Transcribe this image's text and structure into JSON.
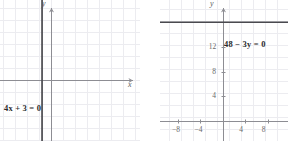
{
  "figure": {
    "background_color": "#ffffff",
    "grid_color": "#ececf0",
    "axis_color": "#8d8d93",
    "curve_color": "#4a4a4f",
    "text_color": "#5c5c5c",
    "label_color": "#2b2b2b"
  },
  "chart_data": [
    {
      "type": "line",
      "title": "",
      "subtitle": "",
      "equation_label": "4x + 3 = 0",
      "xlabel": "x",
      "ylabel": "y",
      "grid": true,
      "legend": "none",
      "annotations": [
        "4x + 3 = 0"
      ],
      "xlim": [
        -4.25,
        7.4
      ],
      "ylim": [
        -5.1,
        6.7
      ],
      "xticks": [],
      "yticks": [],
      "xtick_labels": [],
      "ytick_labels": [],
      "series": [
        {
          "name": "4x + 3 = 0",
          "kind": "vertical-line",
          "x_value": -0.75,
          "x": [
            -0.75,
            -0.75
          ],
          "y": [
            -5.1,
            6.7
          ]
        }
      ]
    },
    {
      "type": "line",
      "title": "",
      "subtitle": "",
      "equation_label": "48 − 3y = 0",
      "xlabel": "",
      "ylabel": "y",
      "grid": true,
      "legend": "none",
      "annotations": [
        "48 − 3y = 0"
      ],
      "xlim": [
        -11.2,
        11.6
      ],
      "ylim": [
        -3.2,
        19.6
      ],
      "xticks": [
        -8,
        -4,
        4,
        8
      ],
      "yticks": [
        4,
        8,
        12
      ],
      "xtick_labels": [
        "−8",
        "−4",
        "4",
        "8"
      ],
      "ytick_labels": [
        "4",
        "8",
        "12"
      ],
      "series": [
        {
          "name": "48 − 3y = 0",
          "kind": "horizontal-line",
          "y_value": 16,
          "x": [
            -11.2,
            11.6
          ],
          "y": [
            16,
            16
          ]
        }
      ]
    }
  ]
}
